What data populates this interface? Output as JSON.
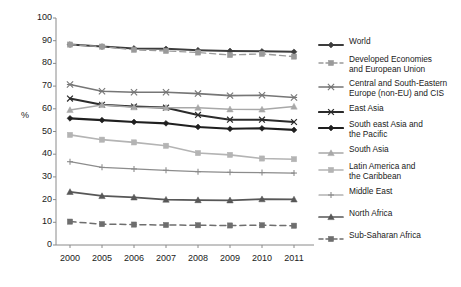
{
  "chart_data": {
    "type": "line",
    "title": "",
    "xlabel": "",
    "ylabel": "%",
    "categories": [
      "2000",
      "2005",
      "2006",
      "2007",
      "2008",
      "2009",
      "2010",
      "2011"
    ],
    "ylim": [
      0,
      100
    ],
    "ytick_labels": [
      "0",
      "10",
      "20",
      "30",
      "40",
      "50",
      "60",
      "70",
      "80",
      "90",
      "100"
    ],
    "ytick_values": [
      0,
      10,
      20,
      30,
      40,
      50,
      60,
      70,
      80,
      90,
      100
    ],
    "grid": false,
    "legend_position": "right",
    "series": [
      {
        "name": "World",
        "color": "#3d3d3d",
        "marker": "diamond",
        "dash": "solid",
        "width": 2.0,
        "values": [
          88.3,
          87.4,
          86.6,
          86.4,
          85.8,
          85.5,
          85.3,
          85.1
        ]
      },
      {
        "name": "Developed Economies and European Union",
        "color": "#9a9a9a",
        "marker": "square",
        "dash": "dashed",
        "width": 1.4,
        "values": [
          88.3,
          87.4,
          86.0,
          85.5,
          84.8,
          83.7,
          84.2,
          83.0
        ]
      },
      {
        "name": "Central and South-Eastern Europe (non-EU) and CIS",
        "color": "#767676",
        "marker": "cross",
        "dash": "solid",
        "width": 1.6,
        "values": [
          70.7,
          67.7,
          67.3,
          67.3,
          66.7,
          65.8,
          66.0,
          65.0
        ]
      },
      {
        "name": "East Asia",
        "color": "#2b2b2b",
        "marker": "x",
        "dash": "solid",
        "width": 2.1,
        "values": [
          64.5,
          61.8,
          61.0,
          60.5,
          57.3,
          55.2,
          55.2,
          54.2
        ]
      },
      {
        "name": "South east Asia and the Pacific",
        "color": "#1f1f1f",
        "marker": "diamond",
        "dash": "solid",
        "width": 2.1,
        "values": [
          55.8,
          55.0,
          54.2,
          53.6,
          52.0,
          51.2,
          51.4,
          50.7
        ]
      },
      {
        "name": "South Asia",
        "color": "#a8a8a8",
        "marker": "triangle",
        "dash": "solid",
        "width": 1.5,
        "values": [
          59.5,
          61.7,
          60.7,
          60.5,
          60.5,
          59.8,
          59.7,
          61.0
        ]
      },
      {
        "name": "Latin America and the Caribbean",
        "color": "#b4b4b4",
        "marker": "square",
        "dash": "solid",
        "width": 1.6,
        "values": [
          48.5,
          46.4,
          45.2,
          43.7,
          40.5,
          39.7,
          38.1,
          37.8
        ]
      },
      {
        "name": "Middle East",
        "color": "#8c8c8c",
        "marker": "plus",
        "dash": "solid",
        "width": 1.2,
        "values": [
          36.7,
          34.2,
          33.5,
          32.9,
          32.3,
          32.0,
          31.9,
          31.7
        ]
      },
      {
        "name": "North Africa",
        "color": "#575757",
        "marker": "triangle",
        "dash": "solid",
        "width": 1.7,
        "values": [
          23.4,
          21.6,
          21.0,
          20.0,
          19.8,
          19.7,
          20.2,
          20.1
        ]
      },
      {
        "name": "Sub-Saharan Africa",
        "color": "#6e6e6e",
        "marker": "square",
        "dash": "dashed",
        "width": 1.5,
        "values": [
          10.3,
          9.2,
          9.0,
          8.8,
          8.7,
          8.6,
          8.7,
          8.5
        ]
      }
    ]
  },
  "legend": {
    "entries": [
      {
        "label": "World",
        "top": 0
      },
      {
        "label": "Developed Economies\nand European Union",
        "top": 18
      },
      {
        "label": "Central and South-Eastern\nEurope (non-EU) and CIS",
        "top": 42
      },
      {
        "label": "East Asia",
        "top": 67
      },
      {
        "label": "South east Asia and\nthe Pacific",
        "top": 83
      },
      {
        "label": "South Asia",
        "top": 108
      },
      {
        "label": "Latin America and\nthe Caribbean",
        "top": 125
      },
      {
        "label": "Middle East",
        "top": 150
      },
      {
        "label": "North Africa",
        "top": 172
      },
      {
        "label": "Sub-Saharan Africa",
        "top": 194
      }
    ]
  },
  "axes": {
    "y_axis_title": "%"
  }
}
